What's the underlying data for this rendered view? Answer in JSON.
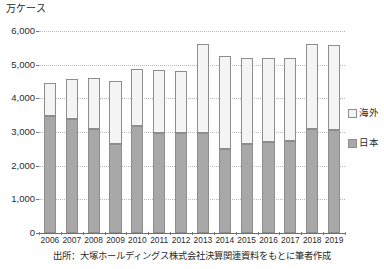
{
  "figure": {
    "unit_label": "万ケース",
    "source_note": "出所：大塚ホールディングス株式会社決算関連資料をもとに筆者作成"
  },
  "legend": {
    "position": "right-middle",
    "items": [
      {
        "label": "海外",
        "color": "#f4f4f4",
        "key": "overseas"
      },
      {
        "label": "日本",
        "color": "#a8a8a8",
        "key": "japan"
      }
    ]
  },
  "axis": {
    "y_ticks": [
      "6,000",
      "5,000",
      "4,000",
      "3,000",
      "2,000",
      "1,000",
      "0"
    ],
    "y_tick_values": [
      6000,
      5000,
      4000,
      3000,
      2000,
      1000,
      0
    ],
    "x_ticks": [
      "2006",
      "2007",
      "2008",
      "2009",
      "2010",
      "2011",
      "2012",
      "2013",
      "2014",
      "2015",
      "2016",
      "2017",
      "2018",
      "2019"
    ]
  },
  "chart_data": {
    "type": "bar",
    "stacked": true,
    "title": "",
    "subtitle": "",
    "xlabel": "",
    "ylabel": "万ケース",
    "ylim": [
      0,
      6000
    ],
    "ytick_step": 1000,
    "grid": true,
    "legend_position": "right",
    "categories": [
      "2006",
      "2007",
      "2008",
      "2009",
      "2010",
      "2011",
      "2012",
      "2013",
      "2014",
      "2015",
      "2016",
      "2017",
      "2018",
      "2019"
    ],
    "series": [
      {
        "name": "日本",
        "color": "#a8a8a8",
        "values": [
          3480,
          3380,
          3080,
          2640,
          3180,
          2980,
          2960,
          2980,
          2500,
          2650,
          2700,
          2740,
          3080,
          3050
        ]
      },
      {
        "name": "海外",
        "color": "#f4f4f4",
        "values": [
          990,
          1200,
          1530,
          1870,
          1700,
          1850,
          1840,
          2620,
          2760,
          2560,
          2510,
          2460,
          2520,
          2530
        ]
      }
    ],
    "totals": [
      4470,
      4580,
      4610,
      4510,
      4880,
      4830,
      4800,
      5600,
      5260,
      5210,
      5210,
      5200,
      5600,
      5580
    ],
    "source": "出所：大塚ホールディングス株式会社決算関連資料をもとに筆者作成"
  }
}
